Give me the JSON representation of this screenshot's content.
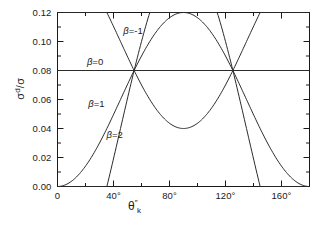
{
  "chart_data": {
    "type": "line",
    "title": "",
    "xlabel": "θ″_k",
    "ylabel": "σ^d/σ",
    "xlim": [
      0,
      180
    ],
    "ylim": [
      0.0,
      0.12
    ],
    "grid": false,
    "legend_position": "inline-annotations",
    "x_tick_labels": [
      "0",
      "40°",
      "80°",
      "120°",
      "160°"
    ],
    "x_tick_values": [
      0,
      40,
      80,
      120,
      160
    ],
    "x_minor_tick_values": [
      20,
      60,
      100,
      140,
      180
    ],
    "y_tick_labels": [
      "0.00",
      "0.02",
      "0.04",
      "0.06",
      "0.08",
      "0.10",
      "0.12"
    ],
    "y_tick_values": [
      0.0,
      0.02,
      0.04,
      0.06,
      0.08,
      0.1,
      0.12
    ],
    "formula": "sigma_d/sigma = 0.08 * (1 - beta * P2(cos theta))",
    "crossing_points_deg": [
      54.7,
      125.3
    ],
    "crossing_value": 0.08,
    "series": [
      {
        "name": "β = -1",
        "beta": -1,
        "label": "β",
        "label_eq": "=",
        "label_value": "-1",
        "label_x_deg": 47,
        "label_y_value": 0.1065,
        "x": [
          0,
          10,
          20,
          30,
          40,
          50,
          54.7,
          60,
          70,
          80,
          90,
          100,
          110,
          120,
          125.3,
          130,
          140,
          150,
          160,
          170,
          180
        ],
        "values": [
          0.12,
          0.1182,
          0.113,
          0.105,
          0.0954,
          0.0854,
          0.08,
          0.0754,
          0.0686,
          0.0647,
          0.064,
          0.0647,
          0.0686,
          0.0754,
          0.08,
          0.0854,
          0.0954,
          0.105,
          0.113,
          0.1182,
          0.12
        ]
      },
      {
        "name": "β = 0",
        "beta": 0,
        "label": "β",
        "label_eq": "=",
        "label_value": "0",
        "label_x_deg": 21,
        "label_y_value": 0.0855,
        "x": [
          0,
          180
        ],
        "values": [
          0.08,
          0.08
        ]
      },
      {
        "name": "β = 1",
        "beta": 1,
        "label": "β",
        "label_eq": "=",
        "label_value": "1",
        "label_x_deg": 22,
        "label_y_value": 0.0565,
        "x": [
          0,
          10,
          20,
          30,
          40,
          50,
          54.7,
          60,
          70,
          80,
          90,
          100,
          110,
          120,
          125.3,
          130,
          140,
          150,
          160,
          170,
          180
        ],
        "values": [
          0.04,
          0.0418,
          0.047,
          0.055,
          0.0646,
          0.0746,
          0.08,
          0.0846,
          0.0914,
          0.0953,
          0.096,
          0.0953,
          0.0914,
          0.0846,
          0.08,
          0.0746,
          0.0646,
          0.055,
          0.047,
          0.0418,
          0.04
        ]
      },
      {
        "name": "β = 2",
        "beta": 2,
        "label": "β",
        "label_eq": "=",
        "label_value": "2",
        "label_x_deg": 35,
        "label_y_value": 0.0345,
        "x": [
          0,
          10,
          20,
          30,
          40,
          50,
          54.7,
          60,
          70,
          80,
          90,
          100,
          110,
          120,
          125.3,
          130,
          140,
          150,
          160,
          170,
          180
        ],
        "values": [
          0.0,
          0.0036,
          0.014,
          0.03,
          0.0491,
          0.0692,
          0.08,
          0.0892,
          0.1028,
          0.1106,
          0.112,
          0.1106,
          0.1028,
          0.0892,
          0.08,
          0.0692,
          0.0491,
          0.03,
          0.014,
          0.0036,
          0.0
        ]
      }
    ]
  },
  "axes": {
    "y_title_numerator": "σ",
    "y_title_sup": "d",
    "y_title_denominator": "σ",
    "y_title_slash": "/",
    "x_title_theta": "θ",
    "x_title_primes": "″",
    "x_title_sub": "k"
  },
  "colors": {
    "background": "#ffffff",
    "axis": "#1a1a1a",
    "curve": "#2b2b2b",
    "text": "#1a1a1a"
  }
}
